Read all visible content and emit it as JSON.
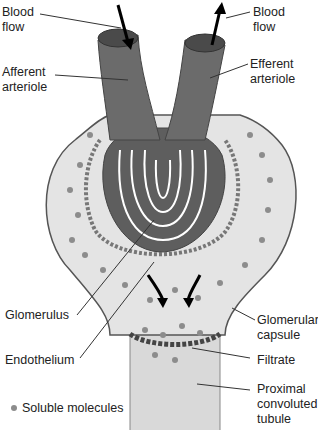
{
  "diagram": {
    "labels": {
      "blood_flow_in": [
        "Blood",
        "flow"
      ],
      "blood_flow_out": [
        "Blood",
        "flow"
      ],
      "afferent": [
        "Afferent",
        "arteriole"
      ],
      "efferent": [
        "Efferent",
        "arteriole"
      ],
      "glomerulus": "Glomerulus",
      "endothelium": "Endothelium",
      "glomerular_capsule": [
        "Glomerular",
        "capsule"
      ],
      "filtrate": "Filtrate",
      "proximal": [
        "Proximal",
        "convoluted",
        "tubule"
      ]
    },
    "legend": {
      "soluble_molecules": "Soluble molecules"
    },
    "colors": {
      "vessel": "#6b6b6b",
      "vessel_dark": "#4a4a4a",
      "capsule_fill": "#e2e2e2",
      "dot": "#8c8c8c",
      "tubule": "#d6d6d6"
    }
  }
}
